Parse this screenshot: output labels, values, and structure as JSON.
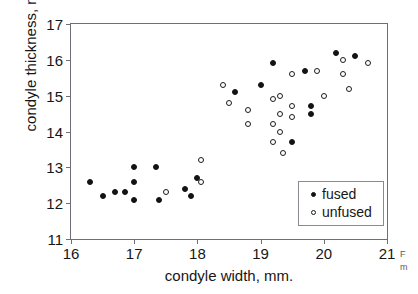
{
  "chart_data": {
    "type": "scatter",
    "title": "",
    "xlabel": "condyle width, mm.",
    "ylabel": "condyle thickness, mm.",
    "xlim": [
      16,
      21
    ],
    "ylim": [
      11,
      17
    ],
    "xticks": [
      16,
      17,
      18,
      19,
      20,
      21
    ],
    "yticks": [
      11,
      12,
      13,
      14,
      15,
      16,
      17
    ],
    "grid": false,
    "legend_position": "lower-right",
    "series": [
      {
        "name": "fused",
        "marker": "filled-circle",
        "color": "#131313",
        "points": [
          [
            16.3,
            12.6
          ],
          [
            16.5,
            12.2
          ],
          [
            16.7,
            12.3
          ],
          [
            16.85,
            12.3
          ],
          [
            17.0,
            13.0
          ],
          [
            17.0,
            12.6
          ],
          [
            17.0,
            12.1
          ],
          [
            17.35,
            13.0
          ],
          [
            17.4,
            12.1
          ],
          [
            17.8,
            12.4
          ],
          [
            17.9,
            12.2
          ],
          [
            18.0,
            12.7
          ],
          [
            18.6,
            15.1
          ],
          [
            19.0,
            15.3
          ],
          [
            19.2,
            15.9
          ],
          [
            19.5,
            13.7
          ],
          [
            19.7,
            15.7
          ],
          [
            19.8,
            14.7
          ],
          [
            19.8,
            14.5
          ],
          [
            20.2,
            16.2
          ],
          [
            20.5,
            16.1
          ]
        ]
      },
      {
        "name": "unfused",
        "marker": "open-circle",
        "color": "#1b1b1b",
        "points": [
          [
            17.5,
            12.3
          ],
          [
            18.05,
            13.2
          ],
          [
            18.05,
            12.6
          ],
          [
            18.4,
            15.3
          ],
          [
            18.5,
            14.8
          ],
          [
            18.8,
            14.6
          ],
          [
            18.8,
            14.2
          ],
          [
            19.2,
            14.9
          ],
          [
            19.2,
            14.2
          ],
          [
            19.2,
            13.7
          ],
          [
            19.3,
            15.0
          ],
          [
            19.3,
            14.5
          ],
          [
            19.3,
            14.0
          ],
          [
            19.35,
            13.4
          ],
          [
            19.5,
            14.7
          ],
          [
            19.5,
            14.4
          ],
          [
            19.5,
            15.6
          ],
          [
            19.9,
            15.7
          ],
          [
            20.0,
            15.0
          ],
          [
            20.3,
            16.0
          ],
          [
            20.3,
            15.6
          ],
          [
            20.4,
            15.2
          ],
          [
            20.7,
            15.9
          ]
        ]
      }
    ]
  },
  "legend": {
    "items": [
      {
        "label": "fused",
        "marker": "filled-circle"
      },
      {
        "label": "unfused",
        "marker": "open-circle"
      }
    ]
  },
  "side_caption": {
    "line1": "F",
    "line2": "m"
  }
}
